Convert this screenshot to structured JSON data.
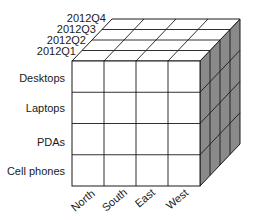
{
  "diagram": {
    "type": "data-cube",
    "quarters": [
      "2012Q1",
      "2012Q2",
      "2012Q3",
      "2012Q4"
    ],
    "products": [
      "Desktops",
      "Laptops",
      "PDAs",
      "Cell phones"
    ],
    "regions": [
      "North",
      "South",
      "East",
      "West"
    ],
    "colors": {
      "front_face": "#ffffff",
      "top_face": "#ffffff",
      "side_face": "#8a8a8a",
      "lines": "#1a1a1a"
    }
  }
}
